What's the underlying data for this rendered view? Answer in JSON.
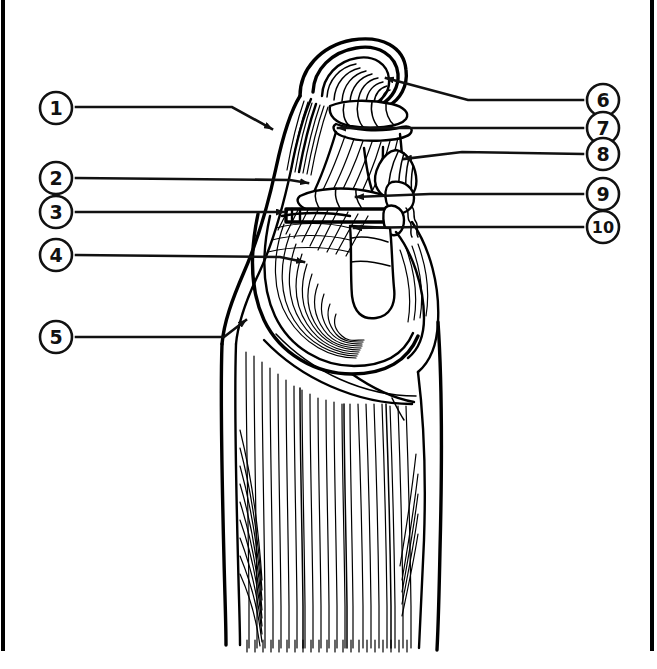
{
  "document": {
    "title": "Anatomy Labeling Diagram",
    "type": "unlabeled anatomical line drawing",
    "subject": "gluteal and hip region musculature, lateral view",
    "background_color": "#ffffff",
    "ink_color": "#000000"
  },
  "frame": {
    "left_bar_color": "#000000",
    "right_bar_color": "#000000"
  },
  "labels": {
    "left": [
      {
        "id": "1",
        "number": "1",
        "circle_cx": 56,
        "circle_cy": 108,
        "arrow_tip_x": 277,
        "arrow_tip_y": 132
      },
      {
        "id": "2",
        "number": "2",
        "circle_cx": 56,
        "circle_cy": 178,
        "arrow_tip_x": 313,
        "arrow_tip_y": 183
      },
      {
        "id": "3",
        "number": "3",
        "circle_cx": 56,
        "circle_cy": 212,
        "arrow_tip_x": 290,
        "arrow_tip_y": 212
      },
      {
        "id": "4",
        "number": "4",
        "circle_cx": 56,
        "circle_cy": 255,
        "arrow_tip_x": 310,
        "arrow_tip_y": 262
      },
      {
        "id": "5",
        "number": "5",
        "circle_cx": 56,
        "circle_cy": 337,
        "arrow_tip_x": 250,
        "arrow_tip_y": 318
      }
    ],
    "right": [
      {
        "id": "6",
        "number": "6",
        "circle_cx": 603,
        "circle_cy": 100,
        "arrow_tip_x": 379,
        "arrow_tip_y": 79
      },
      {
        "id": "7",
        "number": "7",
        "circle_cx": 603,
        "circle_cy": 128,
        "arrow_tip_x": 331,
        "arrow_tip_y": 128
      },
      {
        "id": "8",
        "number": "8",
        "circle_cx": 603,
        "circle_cy": 154,
        "arrow_tip_x": 396,
        "arrow_tip_y": 159
      },
      {
        "id": "9",
        "number": "9",
        "circle_cx": 603,
        "circle_cy": 194,
        "arrow_tip_x": 349,
        "arrow_tip_y": 196
      },
      {
        "id": "10",
        "number": "10",
        "circle_cx": 603,
        "circle_cy": 227,
        "arrow_tip_x": 347,
        "arrow_tip_y": 228
      }
    ]
  }
}
